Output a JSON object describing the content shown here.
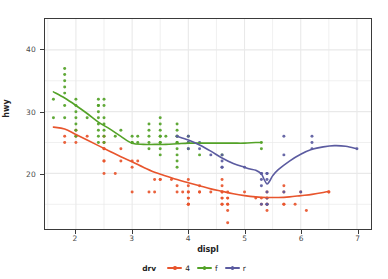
{
  "chart_data": {
    "type": "scatter",
    "title": "",
    "xlabel": "displ",
    "ylabel": "hwy",
    "xlim": [
      1.45,
      7.25
    ],
    "ylim": [
      11.0,
      45.0
    ],
    "xticks": [
      2,
      3,
      4,
      5,
      6,
      7
    ],
    "yticks": [
      20,
      30,
      40
    ],
    "grid": true,
    "legend": {
      "title": "drv",
      "position": "bottom",
      "entries": [
        {
          "label": "4",
          "color": "#e8552d"
        },
        {
          "label": "f",
          "color": "#53a227"
        },
        {
          "label": "r",
          "color": "#5b5ba0"
        }
      ]
    },
    "series": [
      {
        "name": "4",
        "color": "#e8552d",
        "points": [
          [
            1.8,
            26
          ],
          [
            1.8,
            25
          ],
          [
            2.0,
            26
          ],
          [
            2.0,
            27
          ],
          [
            2.0,
            25
          ],
          [
            2.2,
            26
          ],
          [
            2.5,
            26
          ],
          [
            2.5,
            25
          ],
          [
            2.5,
            24
          ],
          [
            2.5,
            24
          ],
          [
            2.5,
            22
          ],
          [
            2.5,
            22
          ],
          [
            2.5,
            20
          ],
          [
            2.7,
            20
          ],
          [
            2.8,
            24
          ],
          [
            2.8,
            22
          ],
          [
            3.0,
            22
          ],
          [
            3.0,
            21
          ],
          [
            3.1,
            22
          ],
          [
            3.3,
            17
          ],
          [
            3.4,
            17
          ],
          [
            3.4,
            19
          ],
          [
            3.5,
            19
          ],
          [
            3.5,
            19
          ],
          [
            3.7,
            19
          ],
          [
            3.8,
            18
          ],
          [
            3.8,
            17
          ],
          [
            3.9,
            17
          ],
          [
            4.0,
            19
          ],
          [
            4.0,
            18
          ],
          [
            4.0,
            17
          ],
          [
            4.0,
            17
          ],
          [
            4.0,
            16
          ],
          [
            4.0,
            16
          ],
          [
            4.0,
            15
          ],
          [
            4.0,
            15
          ],
          [
            4.2,
            17
          ],
          [
            4.2,
            17
          ],
          [
            4.2,
            18
          ],
          [
            4.4,
            17
          ],
          [
            4.6,
            19
          ],
          [
            4.6,
            18
          ],
          [
            4.6,
            17
          ],
          [
            4.6,
            17
          ],
          [
            4.6,
            16
          ],
          [
            4.6,
            16
          ],
          [
            4.6,
            15
          ],
          [
            4.6,
            15
          ],
          [
            4.7,
            17
          ],
          [
            4.7,
            16
          ],
          [
            4.7,
            16
          ],
          [
            4.7,
            15
          ],
          [
            4.7,
            15
          ],
          [
            4.7,
            12
          ],
          [
            4.7,
            14
          ],
          [
            5.0,
            17
          ],
          [
            5.2,
            16
          ],
          [
            5.3,
            16
          ],
          [
            5.3,
            15
          ],
          [
            5.4,
            17
          ],
          [
            5.4,
            16
          ],
          [
            5.4,
            16
          ],
          [
            5.4,
            15
          ],
          [
            5.4,
            15
          ],
          [
            5.4,
            14
          ],
          [
            5.7,
            18
          ],
          [
            5.7,
            17
          ],
          [
            5.7,
            15
          ],
          [
            5.9,
            15
          ],
          [
            6.0,
            17
          ],
          [
            6.1,
            14
          ],
          [
            6.5,
            17
          ],
          [
            6.5,
            17
          ],
          [
            5.7,
            15
          ],
          [
            4.0,
            15
          ],
          [
            3.0,
            17
          ]
        ],
        "smooth": [
          [
            1.6,
            27.5
          ],
          [
            1.8,
            27.2
          ],
          [
            2.0,
            26.3
          ],
          [
            2.2,
            25.4
          ],
          [
            2.4,
            24.5
          ],
          [
            2.6,
            23.6
          ],
          [
            2.8,
            22.7
          ],
          [
            3.0,
            21.9
          ],
          [
            3.2,
            21.0
          ],
          [
            3.4,
            20.2
          ],
          [
            3.6,
            19.6
          ],
          [
            3.8,
            19.0
          ],
          [
            4.0,
            18.5
          ],
          [
            4.2,
            18.0
          ],
          [
            4.4,
            17.5
          ],
          [
            4.6,
            17.1
          ],
          [
            4.8,
            16.7
          ],
          [
            5.0,
            16.4
          ],
          [
            5.2,
            16.2
          ],
          [
            5.4,
            16.1
          ],
          [
            5.6,
            16.1
          ],
          [
            5.8,
            16.2
          ],
          [
            6.0,
            16.4
          ],
          [
            6.2,
            16.6
          ],
          [
            6.4,
            16.9
          ],
          [
            6.5,
            17.1
          ]
        ]
      },
      {
        "name": "f",
        "color": "#53a227",
        "points": [
          [
            1.6,
            29
          ],
          [
            1.6,
            32
          ],
          [
            1.8,
            37
          ],
          [
            1.8,
            36
          ],
          [
            1.8,
            35
          ],
          [
            1.8,
            34
          ],
          [
            1.8,
            33
          ],
          [
            1.8,
            31
          ],
          [
            1.8,
            29
          ],
          [
            2.0,
            31
          ],
          [
            2.0,
            30
          ],
          [
            2.0,
            29
          ],
          [
            2.0,
            28
          ],
          [
            2.0,
            27
          ],
          [
            2.0,
            26
          ],
          [
            2.2,
            29
          ],
          [
            2.4,
            32
          ],
          [
            2.4,
            31
          ],
          [
            2.4,
            31
          ],
          [
            2.4,
            30
          ],
          [
            2.4,
            29
          ],
          [
            2.4,
            28
          ],
          [
            2.4,
            27
          ],
          [
            2.4,
            26
          ],
          [
            2.5,
            32
          ],
          [
            2.5,
            31
          ],
          [
            2.5,
            29
          ],
          [
            2.5,
            28
          ],
          [
            2.5,
            27
          ],
          [
            2.5,
            26
          ],
          [
            2.7,
            26
          ],
          [
            2.8,
            27
          ],
          [
            3.0,
            26
          ],
          [
            3.0,
            25
          ],
          [
            3.0,
            25
          ],
          [
            3.1,
            25
          ],
          [
            3.1,
            26
          ],
          [
            3.3,
            27
          ],
          [
            3.3,
            26
          ],
          [
            3.3,
            25
          ],
          [
            3.3,
            24
          ],
          [
            3.5,
            29
          ],
          [
            3.5,
            28
          ],
          [
            3.5,
            27
          ],
          [
            3.5,
            26
          ],
          [
            3.5,
            26
          ],
          [
            3.5,
            25
          ],
          [
            3.5,
            25
          ],
          [
            3.5,
            24
          ],
          [
            3.6,
            26
          ],
          [
            3.8,
            28
          ],
          [
            3.8,
            27
          ],
          [
            3.8,
            26
          ],
          [
            3.8,
            26
          ],
          [
            3.8,
            25
          ],
          [
            3.8,
            25
          ],
          [
            3.8,
            24
          ],
          [
            3.8,
            23
          ],
          [
            3.8,
            21
          ],
          [
            3.8,
            22
          ],
          [
            4.0,
            26
          ],
          [
            4.0,
            25
          ],
          [
            4.0,
            24
          ],
          [
            4.2,
            23
          ],
          [
            4.6,
            23
          ],
          [
            5.3,
            25
          ],
          [
            5.3,
            24
          ],
          [
            2.0,
            32
          ],
          [
            2.4,
            25
          ],
          [
            3.5,
            23
          ],
          [
            2.5,
            25
          ],
          [
            3.3,
            28
          ]
        ],
        "smooth": [
          [
            1.6,
            33.2
          ],
          [
            1.8,
            32.2
          ],
          [
            2.0,
            31.0
          ],
          [
            2.2,
            29.7
          ],
          [
            2.4,
            28.3
          ],
          [
            2.6,
            27.2
          ],
          [
            2.8,
            26.0
          ],
          [
            3.0,
            24.9
          ],
          [
            3.2,
            24.7
          ],
          [
            3.4,
            24.7
          ],
          [
            3.6,
            24.7
          ],
          [
            3.8,
            24.8
          ],
          [
            4.0,
            24.9
          ],
          [
            4.2,
            24.9
          ],
          [
            4.4,
            24.9
          ],
          [
            4.6,
            24.9
          ],
          [
            4.8,
            24.9
          ],
          [
            5.0,
            24.9
          ],
          [
            5.2,
            25.0
          ],
          [
            5.3,
            25.0
          ]
        ]
      },
      {
        "name": "r",
        "color": "#5b5ba0",
        "points": [
          [
            3.8,
            26
          ],
          [
            4.0,
            26
          ],
          [
            4.0,
            25
          ],
          [
            4.2,
            25
          ],
          [
            4.2,
            24
          ],
          [
            4.4,
            23
          ],
          [
            4.6,
            23
          ],
          [
            4.6,
            22
          ],
          [
            4.6,
            21
          ],
          [
            5.0,
            21
          ],
          [
            5.3,
            20
          ],
          [
            5.3,
            20
          ],
          [
            5.3,
            19
          ],
          [
            5.3,
            18
          ],
          [
            5.4,
            20
          ],
          [
            5.4,
            20
          ],
          [
            5.4,
            19
          ],
          [
            5.4,
            17
          ],
          [
            5.4,
            16
          ],
          [
            5.4,
            15
          ],
          [
            5.7,
            26
          ],
          [
            5.7,
            23
          ],
          [
            5.7,
            17
          ],
          [
            6.0,
            17
          ],
          [
            6.2,
            26
          ],
          [
            6.2,
            25
          ],
          [
            6.2,
            24
          ],
          [
            7.0,
            24
          ],
          [
            5.3,
            15
          ],
          [
            5.4,
            15
          ],
          [
            4.6,
            21
          ],
          [
            4.0,
            24
          ]
        ],
        "smooth": [
          [
            3.8,
            26.0
          ],
          [
            4.0,
            25.4
          ],
          [
            4.2,
            24.6
          ],
          [
            4.4,
            23.6
          ],
          [
            4.6,
            22.5
          ],
          [
            4.8,
            21.6
          ],
          [
            5.0,
            21.0
          ],
          [
            5.1,
            20.7
          ],
          [
            5.2,
            20.5
          ],
          [
            5.3,
            19.9
          ],
          [
            5.35,
            19.0
          ],
          [
            5.4,
            18.3
          ],
          [
            5.45,
            18.8
          ],
          [
            5.5,
            19.6
          ],
          [
            5.6,
            20.6
          ],
          [
            5.8,
            22.0
          ],
          [
            6.0,
            23.1
          ],
          [
            6.2,
            23.9
          ],
          [
            6.4,
            24.3
          ],
          [
            6.6,
            24.5
          ],
          [
            6.8,
            24.4
          ],
          [
            7.0,
            24.0
          ]
        ]
      }
    ]
  },
  "axes": {
    "y_tick_labels": [
      "20",
      "30",
      "40"
    ],
    "x_tick_labels": [
      "2",
      "3",
      "4",
      "5",
      "6",
      "7"
    ],
    "x_title": "displ",
    "y_title": "hwy"
  },
  "legend": {
    "title": "drv",
    "items": [
      {
        "label": "4",
        "color": "#e8552d"
      },
      {
        "label": "f",
        "color": "#53a227"
      },
      {
        "label": "r",
        "color": "#5b5ba0"
      }
    ]
  },
  "style": {
    "panel_background": "#ffffff",
    "grid_color": "#e9e9e9",
    "panel_border": "#3a3a3a",
    "text_color": "#2b2b2b"
  }
}
